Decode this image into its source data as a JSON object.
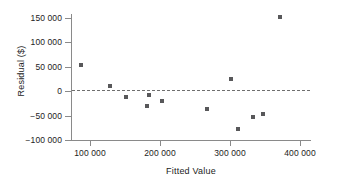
{
  "chart_data": {
    "type": "scatter",
    "title": "",
    "xlabel": "Fitted Value",
    "ylabel": "Residual ($)",
    "xlim": [
      70000,
      414000
    ],
    "ylim": [
      -110000,
      160000
    ],
    "grid": false,
    "legend": "none",
    "reference_line": {
      "type": "horizontal-dashed",
      "y": 0,
      "label": "zero residual line"
    },
    "xticks": [
      100000,
      200000,
      300000,
      400000
    ],
    "xtick_labels": [
      "100 000",
      "200 000",
      "300 000",
      "400 000"
    ],
    "yticks": [
      150000,
      100000,
      50000,
      0,
      -50000,
      -100000
    ],
    "ytick_labels": [
      "150 000",
      "100 000",
      "50 000",
      "0",
      "−50 000",
      "−100 000"
    ],
    "marker": {
      "shape": "square",
      "color": "#58585a",
      "size": 4
    },
    "x": [
      87000,
      128000,
      152000,
      182000,
      184000,
      203000,
      267000,
      302000,
      312000,
      333000,
      347000,
      372000
    ],
    "y": [
      53000,
      10000,
      -11000,
      -30000,
      -7000,
      -20000,
      -36000,
      25000,
      -77000,
      -53000,
      -47000,
      153000
    ],
    "points": [
      {
        "x": 87000,
        "y": 53000
      },
      {
        "x": 128000,
        "y": 10000
      },
      {
        "x": 152000,
        "y": -11000
      },
      {
        "x": 182000,
        "y": -30000
      },
      {
        "x": 184000,
        "y": -7000
      },
      {
        "x": 203000,
        "y": -20000
      },
      {
        "x": 267000,
        "y": -36000
      },
      {
        "x": 302000,
        "y": 25000
      },
      {
        "x": 312000,
        "y": -77000
      },
      {
        "x": 333000,
        "y": -53000
      },
      {
        "x": 347000,
        "y": -47000
      },
      {
        "x": 372000,
        "y": 153000
      }
    ]
  },
  "colors": {
    "marker": "#58585a",
    "axis": "#8a8a8a",
    "text": "#1c1c1c",
    "reference_line": "#6f6f6f",
    "background": "#ffffff"
  }
}
